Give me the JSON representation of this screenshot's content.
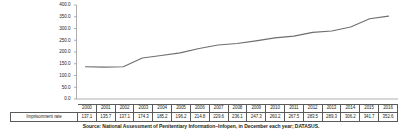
{
  "chart_data": {
    "type": "line",
    "title": "",
    "xlabel": "",
    "ylabel": "",
    "categories": [
      "2000",
      "2001",
      "2002",
      "2003",
      "2004",
      "2005",
      "2006",
      "2007",
      "2008",
      "2009",
      "2010",
      "2011",
      "2012",
      "2013",
      "2014",
      "2015",
      "2016"
    ],
    "series": [
      {
        "name": "Imprisonment rate",
        "values": [
          137.1,
          135.7,
          137.1,
          174.3,
          185.2,
          196.2,
          214.8,
          229.6,
          236.1,
          247.3,
          260.2,
          267.5,
          283.5,
          289.3,
          306.2,
          341.7,
          352.6
        ]
      }
    ],
    "ylim": [
      0,
      400
    ],
    "ytick_labels": [
      "400.0",
      "350.0",
      "300.0",
      "250.0",
      "200.0",
      "150.0",
      "100.0",
      "50.0",
      "0.0"
    ],
    "ytick_values": [
      400,
      350,
      300,
      250,
      200,
      150,
      100,
      50,
      0
    ],
    "grid": false,
    "legend": "none",
    "line_color": "#6d6e70"
  },
  "table": {
    "row_label": "Imprisonment rate",
    "header": [
      "2000",
      "2001",
      "2002",
      "2003",
      "2004",
      "2005",
      "2006",
      "2007",
      "2008",
      "2009",
      "2010",
      "2011",
      "2012",
      "2013",
      "2014",
      "2015",
      "2016"
    ],
    "values": [
      "137.1",
      "135.7",
      "137.1",
      "174.3",
      "185.2",
      "196.2",
      "214.8",
      "229.6",
      "236.1",
      "247.3",
      "260.2",
      "267.5",
      "283.5",
      "289.3",
      "306.2",
      "341.7",
      "352.6"
    ]
  },
  "caption": {
    "source": "Source: National Assessment of Penitentiary Information–Infopen, in December each year; DATASUS."
  }
}
